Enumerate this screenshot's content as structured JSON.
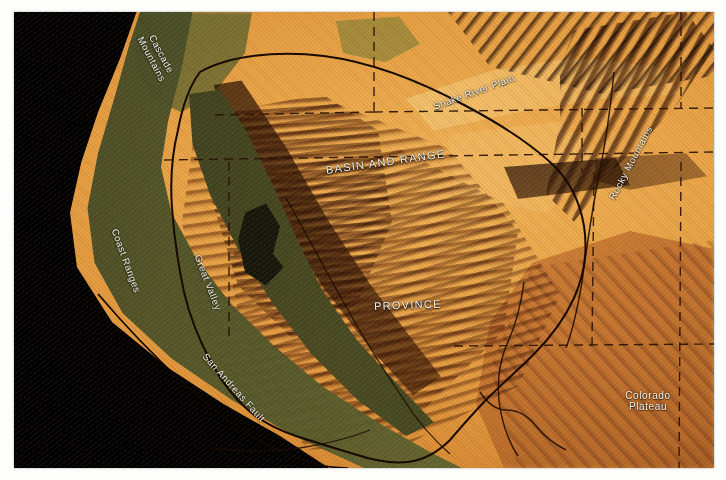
{
  "figure": {
    "name": "shaded-relief-map-basin-and-range",
    "plate_background_color": "#000000",
    "paper_color": "#ffffff"
  },
  "palette": {
    "arid_interior": "#e79f43",
    "ridge_shadow": "#4a210b",
    "coast_green": "#4e5529",
    "great_valley": "#3f4320",
    "colorado_plateau": "#c2712f",
    "ocean_black": "#000000",
    "label_text": "#f4f2ea",
    "boundary_line": "#1d0d04",
    "state_line": "#2a1206"
  },
  "labels": [
    {
      "id": "cascade-mountains",
      "text_line1": "Cascade",
      "text_line2": "Mountains",
      "style": "two-line-rotated"
    },
    {
      "id": "snake-river-plain",
      "text": "Snake River Plain",
      "style": "rotated"
    },
    {
      "id": "rocky-mountains",
      "text": "Rocky Mountains",
      "style": "rotated"
    },
    {
      "id": "basin-and-range",
      "text": "BASIN AND RANGE",
      "style": "caps"
    },
    {
      "id": "province",
      "text": "PROVINCE",
      "style": "caps"
    },
    {
      "id": "coast-ranges",
      "text": "Coast Ranges",
      "style": "rotated"
    },
    {
      "id": "great-valley",
      "text": "Great Valley",
      "style": "rotated"
    },
    {
      "id": "san-andreas-fault",
      "text": "San Andreas Fault",
      "style": "rotated"
    },
    {
      "id": "colorado-plateau",
      "text_line1": "Colorado",
      "text_line2": "Plateau",
      "style": "two-line"
    }
  ],
  "annotations": {
    "province_outline": "closed solid black curve enclosing the Basin and Range Province",
    "state_boundaries": "dashed black straight-line segments",
    "fault_trace": "solid black line along the San Andreas Fault"
  }
}
